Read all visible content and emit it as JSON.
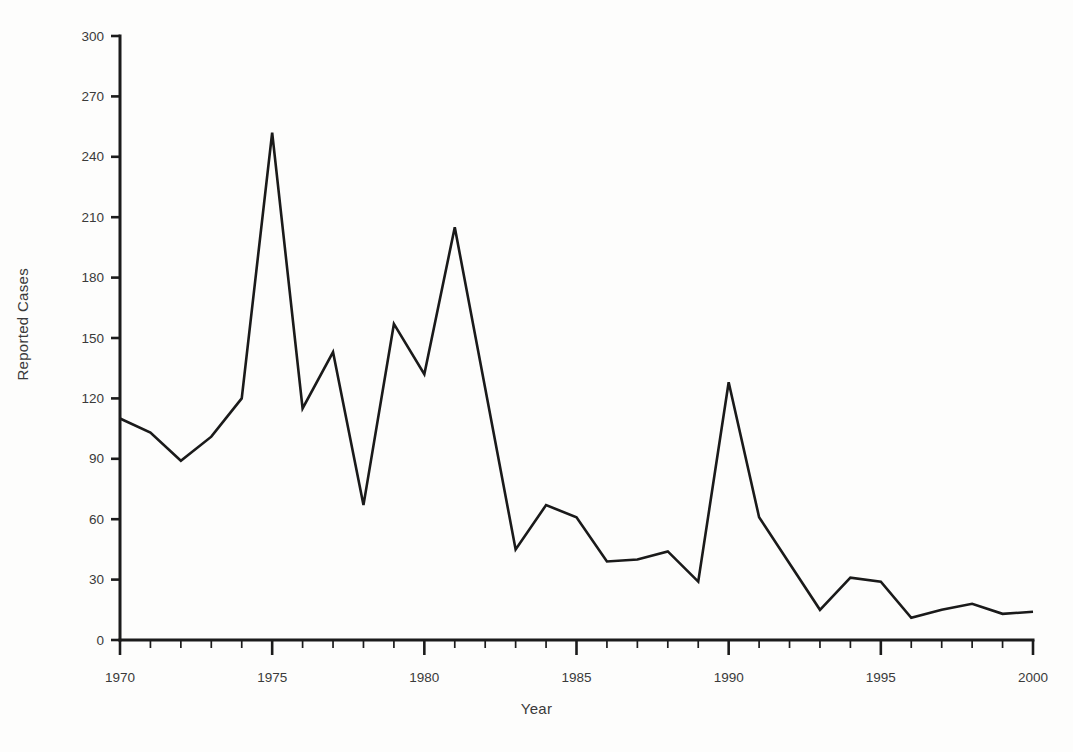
{
  "chart_data": {
    "type": "line",
    "title": "",
    "xlabel": "Year",
    "ylabel": "Reported Cases",
    "xlim": [
      1970,
      2000
    ],
    "ylim": [
      0,
      300
    ],
    "grid": false,
    "legend": null,
    "x_ticks_major": [
      1970,
      1975,
      1980,
      1985,
      1990,
      1995,
      2000
    ],
    "x_tick_labels": [
      "1970",
      "1975",
      "1980",
      "1985",
      "1990",
      "1995",
      "2000"
    ],
    "x_tick_minor_step": 1,
    "y_ticks": [
      0,
      30,
      60,
      90,
      120,
      150,
      180,
      210,
      240,
      270,
      300
    ],
    "y_tick_labels": [
      "0",
      "30",
      "60",
      "90",
      "120",
      "150",
      "180",
      "210",
      "240",
      "270",
      "300"
    ],
    "x": [
      1970,
      1971,
      1972,
      1973,
      1974,
      1975,
      1976,
      1977,
      1978,
      1979,
      1980,
      1981,
      1982,
      1983,
      1984,
      1985,
      1986,
      1987,
      1988,
      1989,
      1990,
      1991,
      1992,
      1993,
      1994,
      1995,
      1996,
      1997,
      1998,
      1999,
      2000
    ],
    "values": [
      110,
      103,
      89,
      101,
      120,
      252,
      115,
      143,
      67,
      157,
      132,
      205,
      125,
      45,
      67,
      61,
      39,
      40,
      44,
      29,
      128,
      61,
      38,
      15,
      31,
      29,
      11,
      15,
      18,
      13,
      14
    ],
    "series": [
      {
        "name": "Reported Cases",
        "color": "#1a1a1a",
        "values": [
          110,
          103,
          89,
          101,
          120,
          252,
          115,
          143,
          67,
          157,
          132,
          205,
          125,
          45,
          67,
          61,
          39,
          40,
          44,
          29,
          128,
          61,
          38,
          15,
          31,
          29,
          11,
          15,
          18,
          13,
          14
        ]
      }
    ],
    "annotations": []
  },
  "colors": {
    "line": "#1a1a1a",
    "axis": "#1b1b1b",
    "text": "#3a3a3a",
    "background": "#fdfdfc"
  }
}
